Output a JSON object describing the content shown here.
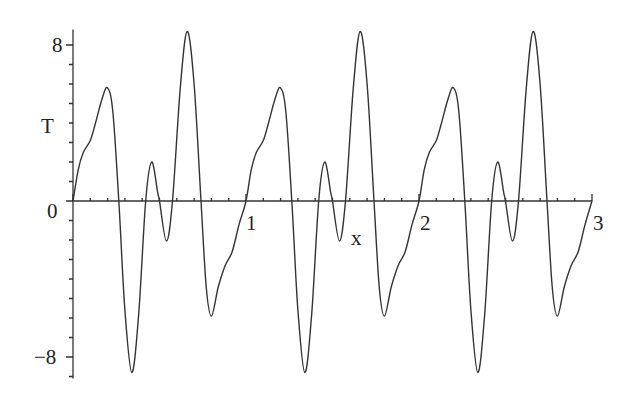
{
  "chart_data": {
    "type": "line",
    "title": "",
    "xlabel": "x",
    "ylabel": "T",
    "xlim": [
      0,
      3
    ],
    "ylim": [
      -9.1,
      8.8
    ],
    "x_ticks": [
      0,
      1,
      2,
      3
    ],
    "x_tick_labels": [
      "",
      "1",
      "2",
      "3"
    ],
    "y_ticks": [
      -8,
      0,
      8
    ],
    "y_tick_labels": [
      "-8",
      "0",
      "8"
    ],
    "grid": false,
    "legend": null,
    "period": 1,
    "series": [
      {
        "name": "T(x)",
        "color": "#333333",
        "one_period_points": [
          [
            0.0,
            0.0
          ],
          [
            0.03,
            1.6
          ],
          [
            0.06,
            2.5
          ],
          [
            0.1,
            3.1
          ],
          [
            0.13,
            4.0
          ],
          [
            0.17,
            5.3
          ],
          [
            0.2,
            5.8
          ],
          [
            0.23,
            4.6
          ],
          [
            0.265,
            0.0
          ],
          [
            0.3,
            -5.6
          ],
          [
            0.34,
            -8.8
          ],
          [
            0.38,
            -5.8
          ],
          [
            0.42,
            0.0
          ],
          [
            0.455,
            2.0
          ],
          [
            0.49,
            0.4
          ],
          [
            0.5,
            0.0
          ],
          [
            0.54,
            -2.05
          ],
          [
            0.575,
            0.0
          ],
          [
            0.62,
            5.8
          ],
          [
            0.66,
            8.7
          ],
          [
            0.7,
            6.0
          ],
          [
            0.74,
            0.0
          ],
          [
            0.77,
            -4.4
          ],
          [
            0.8,
            -5.9
          ],
          [
            0.84,
            -4.4
          ],
          [
            0.88,
            -3.3
          ],
          [
            0.92,
            -2.6
          ],
          [
            0.96,
            -1.2
          ],
          [
            1.0,
            0.0
          ]
        ]
      }
    ]
  },
  "labels": {
    "y_axis": "T",
    "x_axis": "x",
    "y_tick_8": "8",
    "y_tick_0": "0",
    "y_tick_neg8": "−8",
    "x_tick_1": "1",
    "x_tick_2": "2",
    "x_tick_3": "3"
  }
}
